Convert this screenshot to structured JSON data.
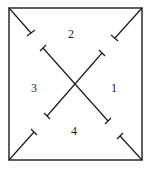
{
  "diagram": {
    "frame": {
      "x1": 9,
      "y1": 8,
      "x2": 142,
      "y2": 160
    },
    "stroke_color": "#1a1a1a",
    "center": {
      "x": 75,
      "y": 84
    },
    "regions": [
      {
        "id": "region-1",
        "label": "1",
        "x": 111,
        "y": 82
      },
      {
        "id": "region-2",
        "label": "2",
        "x": 68,
        "y": 28
      },
      {
        "id": "region-3",
        "label": "3",
        "x": 31,
        "y": 82
      },
      {
        "id": "region-4",
        "label": "4",
        "x": 71,
        "y": 125
      }
    ],
    "segments": [
      {
        "id": "tl-corner-stub",
        "x1": 9,
        "y1": 8,
        "x2": 31,
        "y2": 33
      },
      {
        "id": "tr-corner-stub",
        "x1": 142,
        "y1": 8,
        "x2": 115,
        "y2": 38
      },
      {
        "id": "bl-corner-stub",
        "x1": 9,
        "y1": 160,
        "x2": 34,
        "y2": 132
      },
      {
        "id": "br-corner-stub",
        "x1": 142,
        "y1": 160,
        "x2": 120,
        "y2": 136
      },
      {
        "id": "diag-main-desc",
        "x1": 43,
        "y1": 48,
        "x2": 108,
        "y2": 121
      },
      {
        "id": "diag-main-asc",
        "x1": 102,
        "y1": 53,
        "x2": 47,
        "y2": 116
      }
    ]
  }
}
